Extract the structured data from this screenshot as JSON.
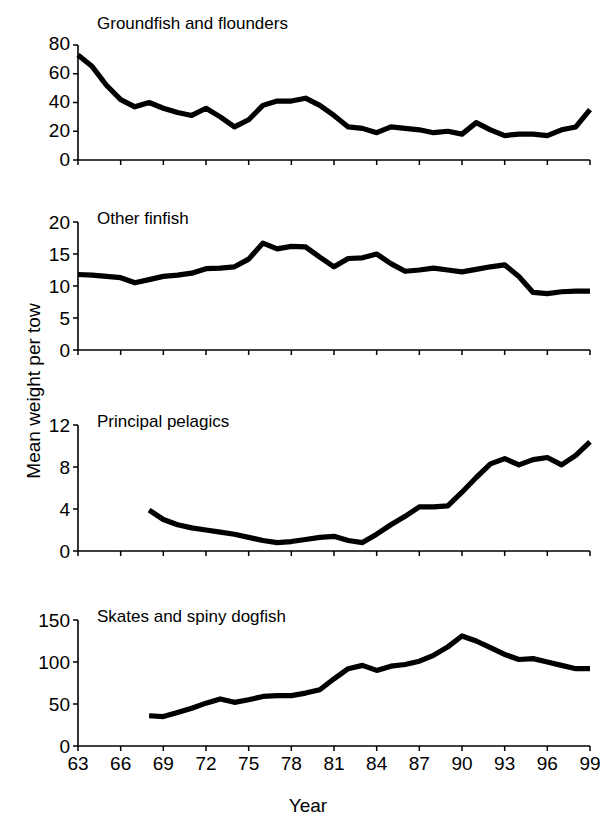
{
  "figure": {
    "ylabel": "Mean weight per tow",
    "xlabel": "Year",
    "x_tick_labels": [
      "63",
      "66",
      "69",
      "72",
      "75",
      "78",
      "81",
      "84",
      "87",
      "90",
      "93",
      "96",
      "99"
    ]
  },
  "panels": {
    "p0": {
      "title": "Groundfish and flounders",
      "y_tick_labels": [
        "80",
        "60",
        "40",
        "20",
        "0"
      ]
    },
    "p1": {
      "title": "Other finfish",
      "y_tick_labels": [
        "20",
        "15",
        "10",
        "5",
        "0"
      ]
    },
    "p2": {
      "title": "Principal pelagics",
      "y_tick_labels": [
        "12",
        "8",
        "4",
        "0"
      ]
    },
    "p3": {
      "title": "Skates and spiny dogfish",
      "y_tick_labels": [
        "150",
        "100",
        "50",
        "0"
      ]
    }
  },
  "chart_data": [
    {
      "type": "line",
      "title": "Groundfish and flounders",
      "xlabel": "Year",
      "ylabel": "Mean weight per tow",
      "xlim": [
        1963,
        1999
      ],
      "ylim": [
        0,
        80
      ],
      "yticks": [
        0,
        20,
        40,
        60,
        80
      ],
      "xticks": [
        1963,
        1966,
        1969,
        1972,
        1975,
        1978,
        1981,
        1984,
        1987,
        1990,
        1993,
        1996,
        1999
      ],
      "grid": false,
      "legend": "none",
      "x": [
        1963,
        1964,
        1965,
        1966,
        1967,
        1968,
        1969,
        1970,
        1971,
        1972,
        1973,
        1974,
        1975,
        1976,
        1977,
        1978,
        1979,
        1980,
        1981,
        1982,
        1983,
        1984,
        1985,
        1986,
        1987,
        1988,
        1989,
        1990,
        1991,
        1992,
        1993,
        1994,
        1995,
        1996,
        1997,
        1998,
        1999
      ],
      "values": [
        73,
        65,
        52,
        42,
        37,
        40,
        36,
        33,
        31,
        36,
        30,
        23,
        28,
        38,
        41,
        41,
        43,
        38,
        31,
        23,
        22,
        19,
        23,
        22,
        21,
        19,
        20,
        18,
        26,
        21,
        17,
        18,
        18,
        17,
        21,
        23,
        35
      ]
    },
    {
      "type": "line",
      "title": "Other finfish",
      "xlabel": "Year",
      "ylabel": "Mean weight per tow",
      "xlim": [
        1963,
        1999
      ],
      "ylim": [
        0,
        20
      ],
      "yticks": [
        0,
        5,
        10,
        15,
        20
      ],
      "xticks": [
        1963,
        1966,
        1969,
        1972,
        1975,
        1978,
        1981,
        1984,
        1987,
        1990,
        1993,
        1996,
        1999
      ],
      "grid": false,
      "legend": "none",
      "x": [
        1963,
        1964,
        1965,
        1966,
        1967,
        1968,
        1969,
        1970,
        1971,
        1972,
        1973,
        1974,
        1975,
        1976,
        1977,
        1978,
        1979,
        1980,
        1981,
        1982,
        1983,
        1984,
        1985,
        1986,
        1987,
        1988,
        1989,
        1990,
        1991,
        1992,
        1993,
        1994,
        1995,
        1996,
        1997,
        1998,
        1999
      ],
      "values": [
        11.8,
        11.7,
        11.5,
        11.3,
        10.5,
        11.0,
        11.5,
        11.7,
        12.0,
        12.7,
        12.8,
        13.0,
        14.2,
        16.7,
        15.8,
        16.2,
        16.1,
        14.5,
        13.0,
        14.3,
        14.4,
        15.0,
        13.5,
        12.3,
        12.5,
        12.8,
        12.5,
        12.2,
        12.6,
        13.0,
        13.3,
        11.5,
        9.0,
        8.8,
        9.1,
        9.2,
        9.2
      ]
    },
    {
      "type": "line",
      "title": "Principal pelagics",
      "xlabel": "Year",
      "ylabel": "Mean weight per tow",
      "xlim": [
        1963,
        1999
      ],
      "ylim": [
        0,
        12
      ],
      "yticks": [
        0,
        4,
        8,
        12
      ],
      "xticks": [
        1963,
        1966,
        1969,
        1972,
        1975,
        1978,
        1981,
        1984,
        1987,
        1990,
        1993,
        1996,
        1999
      ],
      "grid": false,
      "legend": "none",
      "x": [
        1968,
        1969,
        1970,
        1971,
        1972,
        1973,
        1974,
        1975,
        1976,
        1977,
        1978,
        1979,
        1980,
        1981,
        1982,
        1983,
        1984,
        1985,
        1986,
        1987,
        1988,
        1989,
        1990,
        1991,
        1992,
        1993,
        1994,
        1995,
        1996,
        1997,
        1998,
        1999
      ],
      "values": [
        3.9,
        3.0,
        2.5,
        2.2,
        2.0,
        1.8,
        1.6,
        1.3,
        1.0,
        0.8,
        0.9,
        1.1,
        1.3,
        1.4,
        1.0,
        0.8,
        1.6,
        2.5,
        3.3,
        4.2,
        4.2,
        4.3,
        5.6,
        7.0,
        8.3,
        8.8,
        8.2,
        8.7,
        8.9,
        8.2,
        9.1,
        10.4
      ]
    },
    {
      "type": "line",
      "title": "Skates and spiny dogfish",
      "xlabel": "Year",
      "ylabel": "Mean weight per tow",
      "xlim": [
        1963,
        1999
      ],
      "ylim": [
        0,
        150
      ],
      "yticks": [
        0,
        50,
        100,
        150
      ],
      "xticks": [
        1963,
        1966,
        1969,
        1972,
        1975,
        1978,
        1981,
        1984,
        1987,
        1990,
        1993,
        1996,
        1999
      ],
      "grid": false,
      "legend": "none",
      "x": [
        1968,
        1969,
        1970,
        1971,
        1972,
        1973,
        1974,
        1975,
        1976,
        1977,
        1978,
        1979,
        1980,
        1981,
        1982,
        1983,
        1984,
        1985,
        1986,
        1987,
        1988,
        1989,
        1990,
        1991,
        1992,
        1993,
        1994,
        1995,
        1996,
        1997,
        1998,
        1999
      ],
      "values": [
        36,
        35,
        40,
        45,
        51,
        56,
        52,
        55,
        59,
        60,
        60,
        63,
        67,
        80,
        92,
        96,
        90,
        95,
        97,
        101,
        108,
        118,
        131,
        125,
        117,
        109,
        103,
        104,
        100,
        96,
        92,
        92
      ]
    }
  ]
}
